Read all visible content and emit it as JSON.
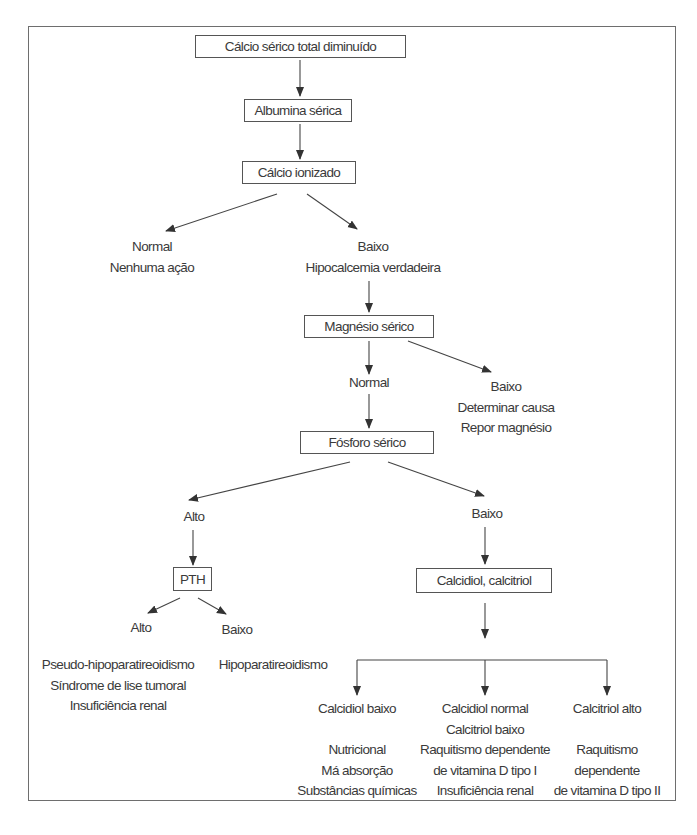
{
  "diagram": {
    "type": "flowchart",
    "title": "Cálcio sérico total diminuído",
    "nodes": {
      "start": "Cálcio sérico total diminuído",
      "albumina": "Albumina sérica",
      "ionizado": "Cálcio ionizado",
      "ion_normal": [
        "Normal",
        "Nenhuma ação"
      ],
      "ion_baixo": [
        "Baixo",
        "Hipocalcemia verdadeira"
      ],
      "magnesio": "Magnésio sérico",
      "mg_normal": "Normal",
      "mg_baixo": [
        "Baixo",
        "Determinar causa",
        "Repor magnésio"
      ],
      "fosforo": "Fósforo sérico",
      "p_alto": "Alto",
      "p_baixo": "Baixo",
      "pth": "PTH",
      "pth_alto": "Alto",
      "pth_baixo": "Baixo",
      "pth_alto_causes": [
        "Pseudo-hipoparatireoidismo",
        "Síndrome de lise tumoral",
        "Insuficiência renal"
      ],
      "pth_baixo_causes": [
        "Hipoparatireoidismo"
      ],
      "calcidiol_calcitriol": "Calcidiol, calcitriol",
      "branch1": {
        "heading": [
          "Calcidiol baixo"
        ],
        "causes": [
          "Nutricional",
          "Má absorção",
          "Substâncias químicas"
        ]
      },
      "branch2": {
        "heading": [
          "Calcidiol normal",
          "Calcitriol baixo"
        ],
        "causes": [
          "Raquitismo dependente",
          "de vitamina D tipo I",
          "Insuficiência renal"
        ]
      },
      "branch3": {
        "heading": [
          "Calcitriol alto"
        ],
        "causes": [
          "Raquitismo",
          "dependente",
          "de vitamina D tipo II"
        ]
      }
    },
    "edges": [
      [
        "start",
        "albumina"
      ],
      [
        "albumina",
        "ionizado"
      ],
      [
        "ionizado",
        "ion_normal"
      ],
      [
        "ionizado",
        "ion_baixo"
      ],
      [
        "ion_baixo",
        "magnesio"
      ],
      [
        "magnesio",
        "mg_normal"
      ],
      [
        "magnesio",
        "mg_baixo"
      ],
      [
        "mg_normal",
        "fosforo"
      ],
      [
        "fosforo",
        "p_alto"
      ],
      [
        "fosforo",
        "p_baixo"
      ],
      [
        "p_alto",
        "pth"
      ],
      [
        "pth",
        "pth_alto"
      ],
      [
        "pth",
        "pth_baixo"
      ],
      [
        "p_baixo",
        "calcidiol_calcitriol"
      ],
      [
        "calcidiol_calcitriol",
        "branch1"
      ],
      [
        "calcidiol_calcitriol",
        "branch2"
      ],
      [
        "calcidiol_calcitriol",
        "branch3"
      ]
    ],
    "colors": {
      "line": "#3a3a3a",
      "border": "#555555",
      "text": "#3a3a3a"
    }
  }
}
